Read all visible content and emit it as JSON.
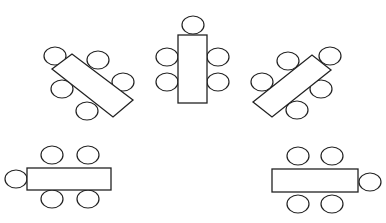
{
  "diagram": {
    "colors": {
      "stroke": "#222222",
      "background": "#ffffff",
      "fill": "#ffffff"
    },
    "tables": [
      {
        "id": "top-left-angled",
        "shape": "polygon",
        "points": "52,69 72,54 133,100 113,117",
        "chairs": [
          {
            "cx": 55,
            "cy": 56,
            "rx": 11,
            "ry": 9
          },
          {
            "cx": 98,
            "cy": 60,
            "rx": 11,
            "ry": 9
          },
          {
            "cx": 123,
            "cy": 82,
            "rx": 11,
            "ry": 9
          },
          {
            "cx": 62,
            "cy": 89,
            "rx": 11,
            "ry": 9
          },
          {
            "cx": 87,
            "cy": 111,
            "rx": 11,
            "ry": 9
          }
        ]
      },
      {
        "id": "top-center-vertical",
        "shape": "rect",
        "x": 178,
        "y": 35,
        "w": 29,
        "h": 68,
        "chairs": [
          {
            "cx": 193,
            "cy": 25,
            "rx": 11,
            "ry": 9
          },
          {
            "cx": 167,
            "cy": 57,
            "rx": 11,
            "ry": 9
          },
          {
            "cx": 167,
            "cy": 82,
            "rx": 11,
            "ry": 9
          },
          {
            "cx": 218,
            "cy": 57,
            "rx": 11,
            "ry": 9
          },
          {
            "cx": 218,
            "cy": 82,
            "rx": 11,
            "ry": 9
          }
        ]
      },
      {
        "id": "top-right-angled",
        "shape": "polygon",
        "points": "253,102 312,55 331,70 272,117",
        "chairs": [
          {
            "cx": 330,
            "cy": 56,
            "rx": 11,
            "ry": 9
          },
          {
            "cx": 288,
            "cy": 61,
            "rx": 11,
            "ry": 9
          },
          {
            "cx": 262,
            "cy": 82,
            "rx": 11,
            "ry": 9
          },
          {
            "cx": 321,
            "cy": 89,
            "rx": 11,
            "ry": 9
          },
          {
            "cx": 297,
            "cy": 110,
            "rx": 11,
            "ry": 9
          }
        ]
      },
      {
        "id": "bottom-left-horizontal",
        "shape": "rect",
        "x": 27,
        "y": 168,
        "w": 84,
        "h": 22,
        "chairs": [
          {
            "cx": 52,
            "cy": 155,
            "rx": 11,
            "ry": 9
          },
          {
            "cx": 88,
            "cy": 155,
            "rx": 11,
            "ry": 9
          },
          {
            "cx": 52,
            "cy": 199,
            "rx": 11,
            "ry": 9
          },
          {
            "cx": 88,
            "cy": 199,
            "rx": 11,
            "ry": 9
          },
          {
            "cx": 16,
            "cy": 179,
            "rx": 11,
            "ry": 9
          }
        ]
      },
      {
        "id": "bottom-right-horizontal",
        "shape": "rect",
        "x": 272,
        "y": 169,
        "w": 86,
        "h": 23,
        "chairs": [
          {
            "cx": 298,
            "cy": 156,
            "rx": 11,
            "ry": 9
          },
          {
            "cx": 332,
            "cy": 156,
            "rx": 11,
            "ry": 9
          },
          {
            "cx": 298,
            "cy": 204,
            "rx": 11,
            "ry": 9
          },
          {
            "cx": 332,
            "cy": 204,
            "rx": 11,
            "ry": 9
          },
          {
            "cx": 370,
            "cy": 182,
            "rx": 11,
            "ry": 9
          }
        ]
      }
    ]
  }
}
